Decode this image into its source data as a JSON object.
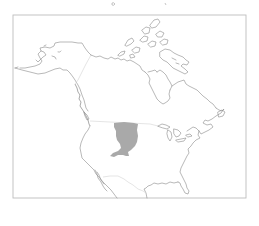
{
  "map": {
    "region": "North America",
    "frame": {
      "x": 13,
      "y": 15,
      "width": 233,
      "height": 183
    },
    "range_area": {
      "label": "",
      "fill_color": "#a9a9a9"
    },
    "colors": {
      "background": "#ffffff",
      "frame": "#bdbdbd",
      "coastline": "#8a8a8a",
      "political_border": "#d4d4d4",
      "range_fill": "#a9a9a9"
    },
    "legend": [],
    "title": ""
  }
}
